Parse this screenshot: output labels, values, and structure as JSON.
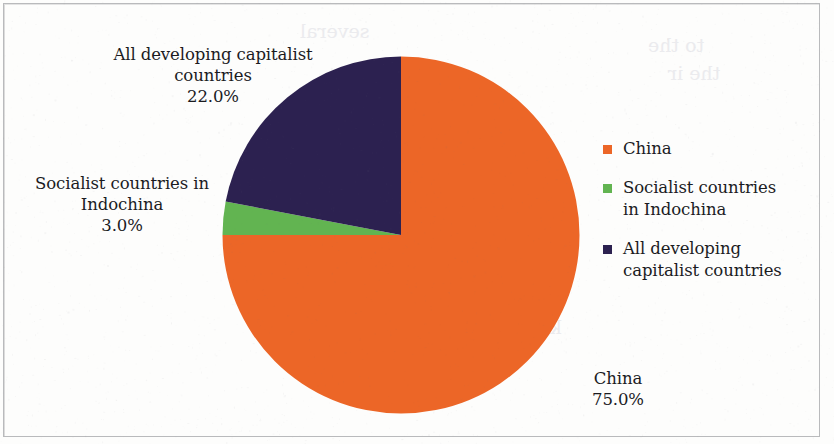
{
  "chart_data": {
    "type": "pie",
    "title": "",
    "categories": [
      "China",
      "Socialist countries in Indochina",
      "All developing capitalist countries"
    ],
    "values": [
      75.0,
      3.0,
      22.0
    ],
    "value_labels": [
      "75.0%",
      "3.0%",
      "22.0%"
    ],
    "colors": [
      "#ec6627",
      "#62b451",
      "#2c2150"
    ],
    "units": "percent",
    "start_angle_deg": 0,
    "direction": "clockwise",
    "legend_position": "right",
    "grid": false
  },
  "pie": {
    "slices": [
      {
        "key": "china",
        "name": "China",
        "percent_label": "75.0%",
        "value": 75.0,
        "color": "#ec6627"
      },
      {
        "key": "indochina",
        "name": "Socialist countries in Indochina",
        "percent_label": "3.0%",
        "value": 3.0,
        "color": "#62b451"
      },
      {
        "key": "capitalist",
        "name": "All developing capitalist countries",
        "percent_label": "22.0%",
        "value": 22.0,
        "color": "#2c2150"
      }
    ]
  },
  "callouts": {
    "navy": {
      "line1": "All developing capitalist",
      "line2": "countries",
      "line3": "22.0%"
    },
    "green": {
      "line1": "Socialist countries in",
      "line2": "Indochina",
      "line3": "3.0%"
    },
    "orange": {
      "line1": "China",
      "line2": "75.0%"
    }
  },
  "legend": {
    "items": [
      {
        "label": "China",
        "color": "#ec6627"
      },
      {
        "label": "Socialist countries\nin Indochina",
        "color": "#62b451"
      },
      {
        "label": "All developing\ncapitalist countries",
        "color": "#2c2150"
      }
    ]
  },
  "ghost_text": {
    "a": "to the",
    "b": "the ir",
    "c": "of the",
    "d": "opened",
    "e": "recent",
    "f": "also that",
    "g": "to operate to be",
    "h": "keep a record of",
    "i": "several"
  }
}
